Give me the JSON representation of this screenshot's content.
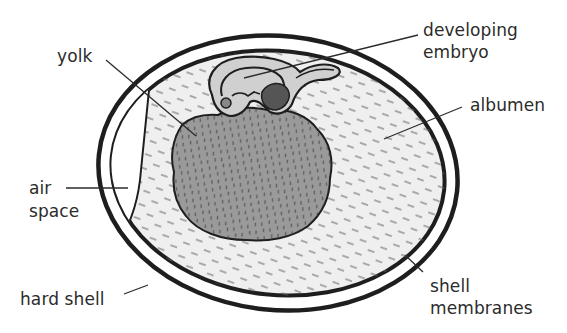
{
  "diagram": {
    "labels": {
      "yolk": "yolk",
      "developing_embryo": [
        "developing",
        "embryo"
      ],
      "albumen": "albumen",
      "air_space": [
        "air",
        "space"
      ],
      "hard_shell": "hard shell",
      "shell_membranes": [
        "shell",
        "membranes"
      ]
    },
    "colors": {
      "outline": "#1e1e1e",
      "label_text": "#2b2b2b",
      "albumen_fill": "#efefef",
      "yolk_fill": "#9a9a9a",
      "embryo_fill": "#c8c8c8",
      "air_space_fill": "#ffffff",
      "texture": "#555555"
    },
    "parts": [
      "hard shell",
      "shell membranes",
      "air space",
      "albumen",
      "yolk",
      "developing embryo"
    ]
  }
}
